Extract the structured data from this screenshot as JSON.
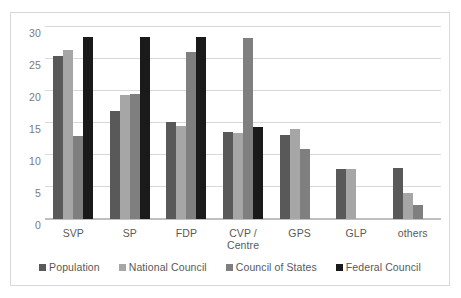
{
  "chart_data": {
    "type": "bar",
    "title": "",
    "subtitle": "",
    "xlabel": "",
    "ylabel": "",
    "ylim": [
      0,
      30
    ],
    "yticks": [
      0,
      5,
      10,
      15,
      20,
      25,
      30
    ],
    "ytick_labels": [
      "0",
      "5",
      "10",
      "15",
      "20",
      "25",
      "30"
    ],
    "grid": true,
    "legend_position": "bottom",
    "categories": [
      "SVP",
      "SP",
      "FDP",
      "CVP / Centre",
      "GPS",
      "GLP",
      "others"
    ],
    "category_lines": [
      [
        "SVP"
      ],
      [
        "SP"
      ],
      [
        "FDP"
      ],
      [
        "CVP /",
        "Centre"
      ],
      [
        "GPS"
      ],
      [
        "GLP"
      ],
      [
        "others"
      ]
    ],
    "series": [
      {
        "name": "Population",
        "color": "#595959",
        "values": [
          25.5,
          16.8,
          15.1,
          13.6,
          13.2,
          7.8,
          8.0
        ]
      },
      {
        "name": "National Council",
        "color": "#a6a6a6",
        "values": [
          26.4,
          19.4,
          14.6,
          13.4,
          14.0,
          7.8,
          4.0
        ]
      },
      {
        "name": "Council of States",
        "color": "#7f7f7f",
        "values": [
          13.0,
          19.5,
          26.1,
          28.3,
          11.0,
          null,
          2.2
        ]
      },
      {
        "name": "Federal Council",
        "color": "#1a1a1a",
        "values": [
          28.5,
          28.5,
          28.5,
          14.3,
          null,
          null,
          null
        ]
      }
    ]
  },
  "style": {
    "gridline_color": "#d9d9d9",
    "axis_color": "#bfbfbf",
    "frame_color": "#d9d9d9",
    "tick_label_color": "#7b7b7b",
    "label_color": "#595959",
    "background": "#ffffff"
  }
}
